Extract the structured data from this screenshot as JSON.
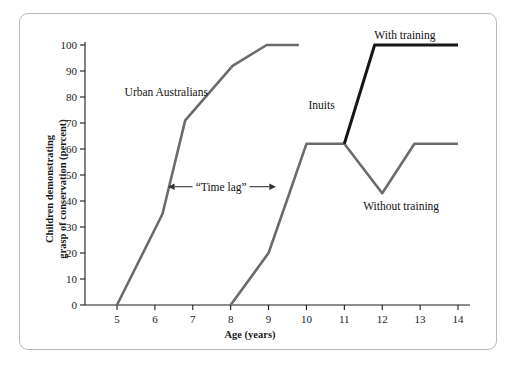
{
  "chart_data": {
    "type": "line",
    "title": "",
    "xlabel": "Age (years)",
    "ylabel_line1": "Children demonstrating",
    "ylabel_line2": "grasp of conservation (percent)",
    "xlim": [
      4.55,
      14.6
    ],
    "ylim": [
      0,
      100
    ],
    "xticks": [
      5,
      6,
      7,
      8,
      9,
      10,
      11,
      12,
      13,
      14
    ],
    "xticklabels": [
      "5",
      "6",
      "7",
      "8",
      "9",
      "10",
      "11",
      "12",
      "13",
      "14"
    ],
    "yticks": [
      0,
      10,
      20,
      30,
      40,
      50,
      60,
      70,
      80,
      90,
      100
    ],
    "yticklabels": [
      "0",
      "10",
      "20",
      "30",
      "40",
      "50",
      "60",
      "70",
      "80",
      "90",
      "100"
    ],
    "grid": false,
    "legend_position": "inline-annotations",
    "series": [
      {
        "name": "Urban Australians",
        "color": "#6b6b6b",
        "linewidth": 2.6,
        "x": [
          5.0,
          6.2,
          6.8,
          8.05,
          8.95,
          9.8
        ],
        "y": [
          0,
          35,
          71,
          92,
          100,
          100
        ]
      },
      {
        "name": "Without training",
        "color": "#6b6b6b",
        "linewidth": 2.6,
        "x": [
          8.0,
          9.0,
          9.55,
          10.0,
          11.0,
          12.0,
          12.85,
          14.0
        ],
        "y": [
          0,
          20,
          43,
          62,
          62,
          43,
          62,
          62
        ]
      },
      {
        "name": "With training",
        "color": "#171717",
        "linewidth": 3.0,
        "x": [
          11.0,
          11.8,
          14.0
        ],
        "y": [
          62,
          100,
          100
        ]
      }
    ],
    "annotations": [
      {
        "text": "Urban Australians",
        "x": 6.3,
        "y": 82
      },
      {
        "text": "Inuits",
        "x": 10.4,
        "y": 77
      },
      {
        "text": "With training",
        "x": 12.6,
        "y": 104
      },
      {
        "text": "Without training",
        "x": 12.5,
        "y": 38
      },
      {
        "text": "“Time lag”",
        "x": 7.75,
        "y": 45.5
      }
    ],
    "time_lag_arrow": {
      "label": "“Time lag”",
      "x_start": 6.52,
      "x_end": 9.02,
      "y": 45.5
    }
  },
  "colors": {
    "frame_border": "#b9b9b9",
    "axis": "#1a1a1a",
    "series_gray": "#6b6b6b",
    "series_black": "#171717",
    "background": "#ffffff",
    "text": "#1a1a1a"
  }
}
